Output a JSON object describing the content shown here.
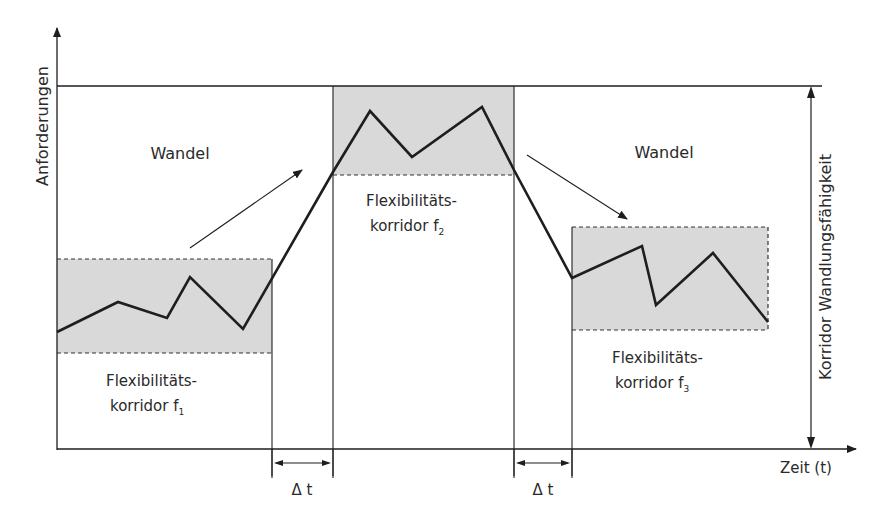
{
  "diagram": {
    "y_axis_label": "Anforderungen",
    "x_axis_label": "Zeit (t)",
    "right_axis_label": "Korridor Wandlungsfähigkeit",
    "change_label_left": "Wandel",
    "change_label_right": "Wandel",
    "corridors": [
      {
        "line1": "Flexibilitäts-",
        "line2": "korridor f",
        "sub": "1"
      },
      {
        "line1": "Flexibilitäts-",
        "line2": "korridor f",
        "sub": "2"
      },
      {
        "line1": "Flexibilitäts-",
        "line2": "korridor f",
        "sub": "3"
      }
    ],
    "delta_labels": [
      "Δ t",
      "Δ t"
    ],
    "colors": {
      "line": "#1e1e1e",
      "corridor_fill": "#d9d9d9",
      "background": "#ffffff"
    }
  }
}
